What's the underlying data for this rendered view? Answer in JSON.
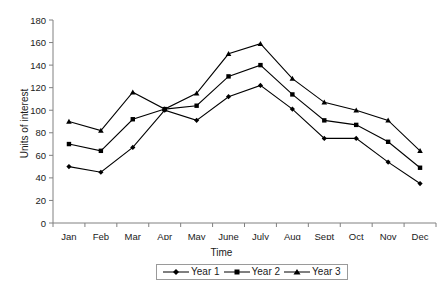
{
  "chart_data": {
    "type": "line",
    "title": "",
    "xlabel": "Time",
    "ylabel": "Units of interest",
    "categories": [
      "Jan",
      "Feb",
      "Mar",
      "Apr",
      "May",
      "June",
      "July",
      "Aug",
      "Sept",
      "Oct",
      "Nov",
      "Dec"
    ],
    "series": [
      {
        "name": "Year 1",
        "values": [
          50,
          45,
          67,
          100,
          91,
          112,
          122,
          101,
          75,
          75,
          54,
          35
        ],
        "color": "#000000",
        "marker": "diamond"
      },
      {
        "name": "Year 2",
        "values": [
          70,
          64,
          92,
          101,
          104,
          130,
          140,
          114,
          91,
          87,
          72,
          49
        ],
        "color": "#000000",
        "marker": "square"
      },
      {
        "name": "Year 3",
        "values": [
          90,
          82,
          116,
          101,
          115,
          150,
          159,
          128,
          107,
          100,
          91,
          64
        ],
        "color": "#000000",
        "marker": "triangle"
      }
    ],
    "ylim": [
      0,
      180
    ],
    "yticks": [
      0,
      20,
      40,
      60,
      80,
      100,
      120,
      140,
      160,
      180
    ],
    "ytick_labels": [
      "0",
      "20",
      "40",
      "60",
      "80",
      "100",
      "120",
      "140",
      "160",
      "180"
    ],
    "grid": false,
    "legend_position": "bottom",
    "axis_color": "#808080",
    "line_color": "#000000",
    "background": "#ffffff"
  },
  "legend": {
    "items": [
      {
        "label": "Year 1",
        "marker": "diamond"
      },
      {
        "label": "Year 2",
        "marker": "square"
      },
      {
        "label": "Year 3",
        "marker": "triangle"
      }
    ]
  }
}
